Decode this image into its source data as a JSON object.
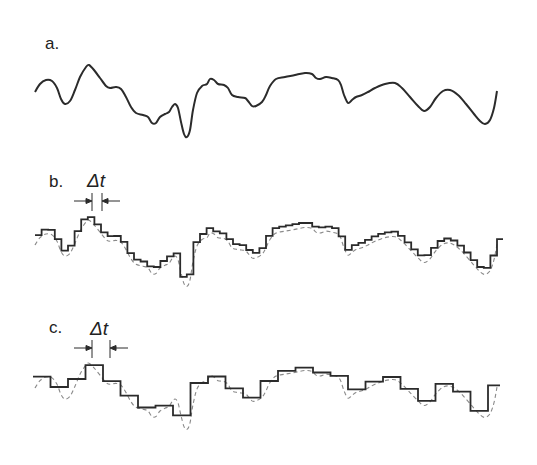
{
  "figure": {
    "panels": [
      {
        "id": "a",
        "label": "a.",
        "description": "continuous signal"
      },
      {
        "id": "b",
        "label": "b.",
        "description": "sampled step signal with small interval",
        "interval_label": "Δt"
      },
      {
        "id": "c",
        "label": "c.",
        "description": "sampled step signal with large interval",
        "interval_label": "Δt"
      }
    ],
    "colors": {
      "signal": "#2b2b2b",
      "reference_dashed": "#8a8a8a",
      "background": "#ffffff"
    },
    "curve_points": [
      [
        35,
        92
      ],
      [
        40,
        84
      ],
      [
        46,
        80
      ],
      [
        52,
        81
      ],
      [
        57,
        88
      ],
      [
        61,
        99
      ],
      [
        65,
        104
      ],
      [
        70,
        101
      ],
      [
        75,
        90
      ],
      [
        80,
        77
      ],
      [
        86,
        67
      ],
      [
        89,
        65
      ],
      [
        94,
        70
      ],
      [
        100,
        78
      ],
      [
        106,
        86
      ],
      [
        110,
        88
      ],
      [
        116,
        87
      ],
      [
        121,
        89
      ],
      [
        126,
        97
      ],
      [
        131,
        107
      ],
      [
        136,
        113
      ],
      [
        143,
        115
      ],
      [
        148,
        117
      ],
      [
        152,
        123
      ],
      [
        156,
        123
      ],
      [
        160,
        117
      ],
      [
        165,
        114
      ],
      [
        169,
        112
      ],
      [
        172,
        107
      ],
      [
        175,
        104
      ],
      [
        178,
        108
      ],
      [
        181,
        122
      ],
      [
        184,
        134
      ],
      [
        187,
        137
      ],
      [
        190,
        130
      ],
      [
        193,
        110
      ],
      [
        197,
        93
      ],
      [
        202,
        86
      ],
      [
        207,
        84
      ],
      [
        210,
        79
      ],
      [
        214,
        80
      ],
      [
        218,
        84
      ],
      [
        224,
        85
      ],
      [
        228,
        88
      ],
      [
        232,
        95
      ],
      [
        238,
        97
      ],
      [
        245,
        98
      ],
      [
        248,
        101
      ],
      [
        252,
        106
      ],
      [
        256,
        106
      ],
      [
        262,
        102
      ],
      [
        266,
        95
      ],
      [
        270,
        86
      ],
      [
        276,
        79
      ],
      [
        285,
        77
      ],
      [
        295,
        75
      ],
      [
        305,
        73
      ],
      [
        312,
        74
      ],
      [
        316,
        78
      ],
      [
        320,
        79
      ],
      [
        326,
        77
      ],
      [
        332,
        78
      ],
      [
        338,
        80
      ],
      [
        341,
        85
      ],
      [
        344,
        95
      ],
      [
        348,
        103
      ],
      [
        352,
        100
      ],
      [
        356,
        97
      ],
      [
        362,
        95
      ],
      [
        368,
        92
      ],
      [
        375,
        88
      ],
      [
        385,
        84
      ],
      [
        395,
        83
      ],
      [
        402,
        88
      ],
      [
        410,
        97
      ],
      [
        418,
        106
      ],
      [
        424,
        111
      ],
      [
        430,
        107
      ],
      [
        436,
        98
      ],
      [
        443,
        91
      ],
      [
        450,
        90
      ],
      [
        458,
        95
      ],
      [
        466,
        104
      ],
      [
        474,
        114
      ],
      [
        480,
        121
      ],
      [
        485,
        124
      ],
      [
        490,
        120
      ],
      [
        494,
        108
      ],
      [
        497,
        91
      ]
    ]
  }
}
